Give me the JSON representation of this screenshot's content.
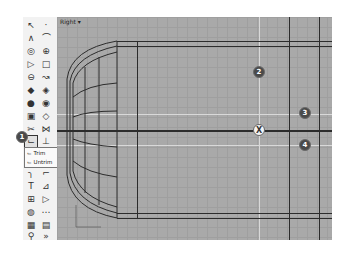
{
  "viewport": {
    "label": "Right",
    "dropdown_glyph": "▾"
  },
  "toolbar": {
    "tools": [
      {
        "name": "select-icon",
        "glyph": "↖"
      },
      {
        "name": "point-icon",
        "glyph": "·"
      },
      {
        "name": "polyline-icon",
        "glyph": "∧"
      },
      {
        "name": "curve-icon",
        "glyph": "⌒"
      },
      {
        "name": "circle-icon",
        "glyph": "◎"
      },
      {
        "name": "ellipse-icon",
        "glyph": "⊕"
      },
      {
        "name": "polygon-icon",
        "glyph": "▷"
      },
      {
        "name": "rectangle-icon",
        "glyph": "□"
      },
      {
        "name": "arc-icon",
        "glyph": "⊖"
      },
      {
        "name": "freeform-icon",
        "glyph": "↝"
      },
      {
        "name": "surface-icon",
        "glyph": "◆"
      },
      {
        "name": "surface-edit-icon",
        "glyph": "◈"
      },
      {
        "name": "solid-icon",
        "glyph": "●"
      },
      {
        "name": "solid-edit-icon",
        "glyph": "◉"
      },
      {
        "name": "mesh-icon",
        "glyph": "▣"
      },
      {
        "name": "mesh-edit-icon",
        "glyph": "◇"
      },
      {
        "name": "split-icon",
        "glyph": "✂"
      },
      {
        "name": "explode-icon",
        "glyph": "⋈"
      },
      {
        "name": "trim-icon",
        "glyph": "⌙"
      },
      {
        "name": "extend-icon",
        "glyph": "⊥"
      },
      {
        "name": "fillet-icon",
        "glyph": "╮"
      },
      {
        "name": "chamfer-icon",
        "glyph": "⌐"
      },
      {
        "name": "move-icon",
        "glyph": "T"
      },
      {
        "name": "offset-icon",
        "glyph": "⊿"
      },
      {
        "name": "array-icon",
        "glyph": "⊞"
      },
      {
        "name": "mirror-icon",
        "glyph": "▷"
      },
      {
        "name": "render-icon",
        "glyph": "◍"
      },
      {
        "name": "dimension-icon",
        "glyph": "⋯"
      },
      {
        "name": "layer-icon",
        "glyph": "▦"
      },
      {
        "name": "properties-icon",
        "glyph": "▤"
      },
      {
        "name": "analyze-icon",
        "glyph": "⚲"
      },
      {
        "name": "more-icon",
        "glyph": "»"
      }
    ],
    "flyout": {
      "items": [
        {
          "label": "Trim",
          "glyph": "⌙"
        },
        {
          "label": "Untrim",
          "glyph": "⌙"
        }
      ]
    }
  },
  "callouts": {
    "c1": "1",
    "c2": "2",
    "c3": "3",
    "c4": "4"
  },
  "marker": {
    "glyph": "X"
  },
  "colors": {
    "viewport_bg": "#a9a9a9",
    "grid_line": "#9f9f9f",
    "axis_light": "#d9d9d9",
    "geometry_dark": "#2c2c2c",
    "callout_bg": "#4a4a4a"
  }
}
